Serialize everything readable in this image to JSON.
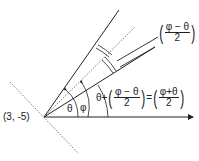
{
  "diagram": {
    "point_label": "(3, -5)",
    "angle_theta": "θ",
    "angle_phi": "φ",
    "top_fraction": {
      "numerator": "φ − θ",
      "denominator": "2"
    },
    "equation": {
      "lhs_prefix": "θ+",
      "lhs_fraction": {
        "numerator": "φ − θ",
        "denominator": "2"
      },
      "equals": "=",
      "rhs_fraction": {
        "numerator": "φ+θ",
        "denominator": "2"
      }
    },
    "colors": {
      "line": "#222222",
      "dotted": "#555555"
    }
  }
}
